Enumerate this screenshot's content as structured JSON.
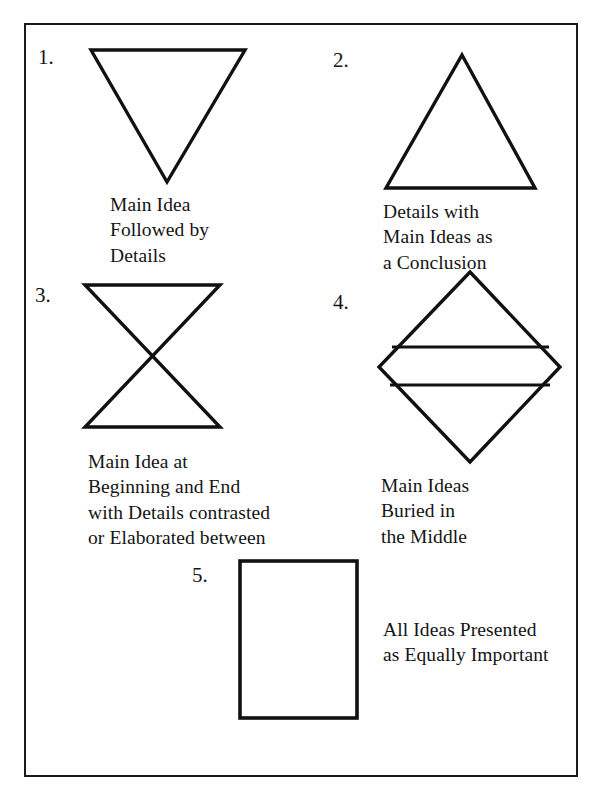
{
  "document": {
    "title": "Text Structure Patterns Diagram",
    "background_color": "#ffffff",
    "ink_color": "#1b1b1b",
    "frame": {
      "x": 24,
      "y": 23,
      "width": 554,
      "height": 754,
      "border_width": 2
    }
  },
  "items": [
    {
      "number": "1.",
      "shape": "inverted-triangle",
      "caption": "Main Idea\nFollowed by\nDetails",
      "caption_lines": [
        "Main Idea",
        "Followed by",
        "Details"
      ]
    },
    {
      "number": "2.",
      "shape": "triangle",
      "caption": "Details with\nMain Ideas as\na Conclusion",
      "caption_lines": [
        "Details with",
        "Main Ideas as",
        "a Conclusion"
      ]
    },
    {
      "number": "3.",
      "shape": "hourglass",
      "caption": "Main Idea at\nBeginning and End\nwith Details contrasted\nor Elaborated between",
      "caption_lines": [
        "Main Idea at",
        "Beginning and End",
        "with Details contrasted",
        "or Elaborated between"
      ]
    },
    {
      "number": "4.",
      "shape": "diamond-with-bands",
      "caption": "Main Ideas\nBuried in\nthe Middle",
      "caption_lines": [
        "Main Ideas",
        "Buried in",
        "the Middle"
      ]
    },
    {
      "number": "5.",
      "shape": "rectangle",
      "caption": "All Ideas Presented\nas Equally Important",
      "caption_lines": [
        "All Ideas Presented",
        "as Equally Important"
      ]
    }
  ],
  "shape_geometry": {
    "inverted_triangle_1": {
      "points": "91,50 245,50 167,182",
      "stroke": 3
    },
    "triangle_2": {
      "points": "462,55 535,188 386,188",
      "stroke": 3
    },
    "hourglass_3": {
      "points": "85,285 220,285 85,427 220,427",
      "stroke": 3
    },
    "diamond_4": {
      "points": "470,272 560,367 470,462 379,367",
      "stroke": 3,
      "band_lines": [
        {
          "x1": 394,
          "y1": 347,
          "x2": 547,
          "y2": 347
        },
        {
          "x1": 392,
          "y1": 385,
          "x2": 548,
          "y2": 385
        }
      ]
    },
    "rectangle_5": {
      "x": 240,
      "y": 561,
      "width": 117,
      "height": 157,
      "stroke": 3
    }
  }
}
